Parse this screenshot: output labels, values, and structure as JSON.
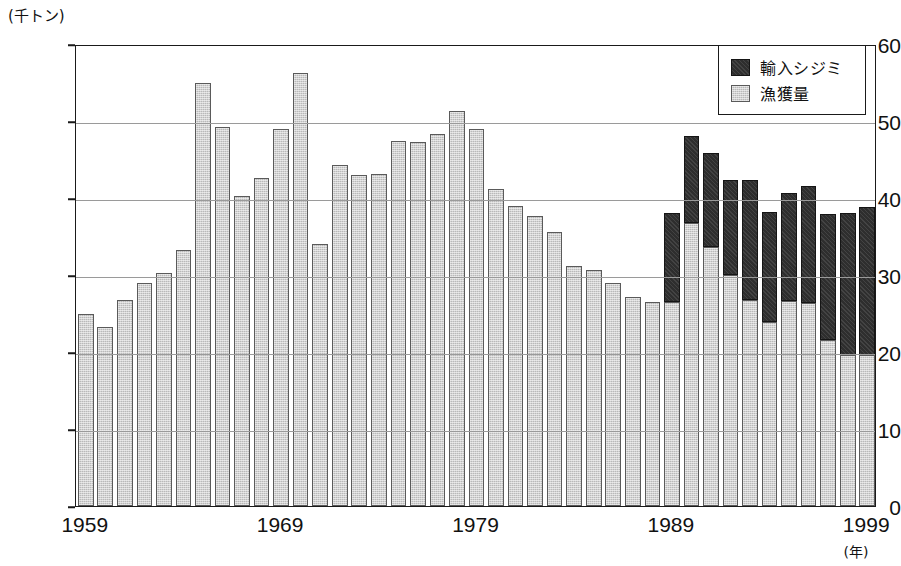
{
  "chart_data": {
    "type": "bar",
    "stacked": true,
    "title": "",
    "xlabel": "(年)",
    "ylabel": "(千トン)",
    "yunit_caption": "(千トン)",
    "xunit_caption": "(年)",
    "ylim": [
      0,
      60
    ],
    "ytick_values": [
      0,
      10,
      20,
      30,
      40,
      50,
      60
    ],
    "ytick_labels": [
      "0",
      "10",
      "20",
      "30",
      "40",
      "50",
      "60"
    ],
    "grid": true,
    "grid_axis": "y",
    "legend_position": "top-right",
    "categories": [
      1959,
      1960,
      1961,
      1962,
      1963,
      1964,
      1965,
      1966,
      1967,
      1968,
      1969,
      1970,
      1971,
      1972,
      1973,
      1974,
      1975,
      1976,
      1977,
      1978,
      1979,
      1980,
      1981,
      1982,
      1983,
      1984,
      1985,
      1986,
      1987,
      1988,
      1989,
      1990,
      1991,
      1992,
      1993,
      1994,
      1995,
      1996,
      1997,
      1998,
      1999
    ],
    "xtick_labels": [
      "1959",
      "1969",
      "1979",
      "1989",
      "1999"
    ],
    "xtick_values": [
      1959,
      1969,
      1979,
      1989,
      1999
    ],
    "series": [
      {
        "name": "漁獲量",
        "key": "catch",
        "color": "#b9b9b9",
        "values": [
          25.0,
          23.2,
          26.8,
          29.0,
          30.2,
          33.3,
          55.0,
          49.2,
          40.3,
          42.6,
          49.0,
          56.2,
          34.0,
          44.3,
          43.0,
          43.1,
          47.4,
          47.3,
          48.3,
          51.3,
          49.0,
          41.2,
          39.0,
          37.6,
          35.6,
          31.2,
          30.7,
          28.9,
          27.1,
          26.5,
          26.5,
          36.8,
          33.6,
          30.0,
          26.7,
          23.9,
          26.6,
          26.4,
          21.5,
          19.6,
          19.6
        ]
      },
      {
        "name": "輸入シジミ",
        "key": "imports",
        "color": "#2e2e2e",
        "values": [
          0,
          0,
          0,
          0,
          0,
          0,
          0,
          0,
          0,
          0,
          0,
          0,
          0,
          0,
          0,
          0,
          0,
          0,
          0,
          0,
          0,
          0,
          0,
          0,
          0,
          0,
          0,
          0,
          0,
          0,
          11.5,
          11.2,
          12.2,
          12.4,
          15.6,
          14.3,
          14.0,
          15.1,
          16.4,
          18.4,
          19.2
        ]
      }
    ],
    "totals": [
      25.0,
      23.2,
      26.8,
      29.0,
      30.2,
      33.3,
      55.0,
      49.2,
      40.3,
      42.6,
      49.0,
      56.2,
      34.0,
      44.3,
      43.0,
      43.1,
      47.4,
      47.3,
      48.3,
      51.3,
      49.0,
      41.2,
      39.0,
      37.6,
      35.6,
      31.2,
      30.7,
      28.9,
      27.1,
      26.5,
      38.0,
      48.0,
      45.8,
      42.4,
      42.3,
      38.2,
      40.6,
      41.5,
      37.9,
      38.0,
      38.8
    ]
  },
  "legend": {
    "items": [
      {
        "label": "輸入シジミ",
        "key": "imports"
      },
      {
        "label": "漁獲量",
        "key": "catch"
      }
    ]
  }
}
